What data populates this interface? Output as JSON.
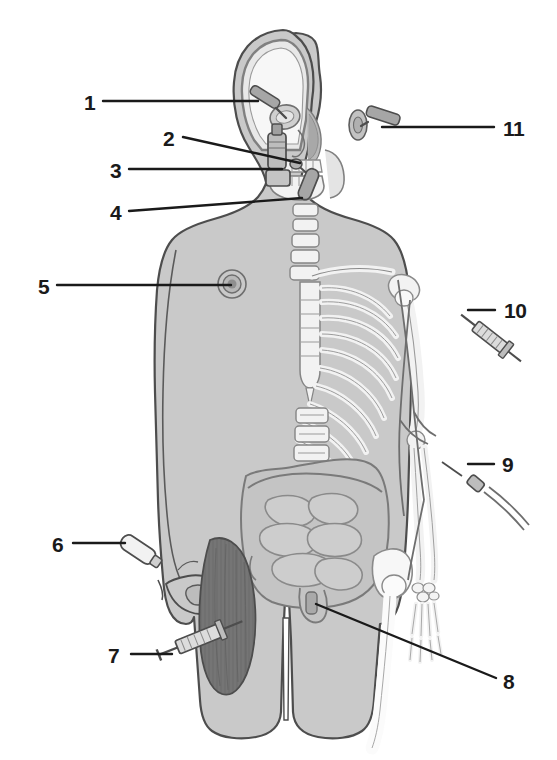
{
  "figure": {
    "background_color": "#ffffff",
    "body_fill": "#c9c9c9",
    "bone_fill": "#f2f2f2",
    "organ_fill": "#bdbdbd",
    "muscle_fill": "#8a8a8a",
    "outline_color": "#5a5a5a",
    "leader_color": "#1a1a1a",
    "label_color": "#1a1a1a"
  },
  "labels": [
    {
      "id": "1",
      "text": "1",
      "x": 84,
      "y": 92,
      "target": "eye-dropper",
      "side": "left"
    },
    {
      "id": "2",
      "text": "2",
      "x": 163,
      "y": 128,
      "target": "nasal-spray",
      "side": "left"
    },
    {
      "id": "3",
      "text": "3",
      "x": 110,
      "y": 160,
      "target": "sublingual-tablet",
      "side": "left"
    },
    {
      "id": "4",
      "text": "4",
      "x": 110,
      "y": 202,
      "target": "oral-route",
      "side": "left"
    },
    {
      "id": "5",
      "text": "5",
      "x": 38,
      "y": 276,
      "target": "transdermal-patch",
      "side": "left"
    },
    {
      "id": "6",
      "text": "6",
      "x": 52,
      "y": 534,
      "target": "topical-cream",
      "side": "left"
    },
    {
      "id": "7",
      "text": "7",
      "x": 108,
      "y": 645,
      "target": "intramuscular",
      "side": "left"
    },
    {
      "id": "8",
      "text": "8",
      "x": 503,
      "y": 683,
      "target": "rectal-suppository",
      "side": "right"
    },
    {
      "id": "9",
      "text": "9",
      "x": 502,
      "y": 454,
      "target": "intravenous",
      "side": "right"
    },
    {
      "id": "10",
      "text": "10",
      "x": 504,
      "y": 300,
      "target": "subcutaneous",
      "side": "right"
    },
    {
      "id": "11",
      "text": "11",
      "x": 503,
      "y": 118,
      "target": "ear-drops",
      "side": "right"
    }
  ],
  "anatomy": {
    "regions": [
      "head",
      "cranium",
      "orbit",
      "nasal-cavity",
      "mandible",
      "teeth",
      "cervical-vertebrae",
      "clavicle",
      "sternum",
      "ribcage",
      "humerus",
      "radius",
      "ulna",
      "carpals",
      "metacarpals",
      "phalanges",
      "lumbar-vertebrae",
      "pelvis",
      "femur",
      "large-intestine",
      "small-intestine",
      "rectum",
      "vastus-lateralis-muscle",
      "nipple"
    ]
  },
  "devices": [
    {
      "name": "eye-dropper",
      "label_ref": "1"
    },
    {
      "name": "nasal-spray",
      "label_ref": "2"
    },
    {
      "name": "sublingual-tablet",
      "label_ref": "3"
    },
    {
      "name": "oral-capsule",
      "label_ref": "4"
    },
    {
      "name": "transdermal-patch",
      "label_ref": "5"
    },
    {
      "name": "topical-tube",
      "label_ref": "6"
    },
    {
      "name": "im-syringe",
      "label_ref": "7"
    },
    {
      "name": "suppository",
      "label_ref": "8"
    },
    {
      "name": "iv-cannula",
      "label_ref": "9"
    },
    {
      "name": "sc-syringe",
      "label_ref": "10"
    },
    {
      "name": "ear-dropper",
      "label_ref": "11"
    }
  ]
}
